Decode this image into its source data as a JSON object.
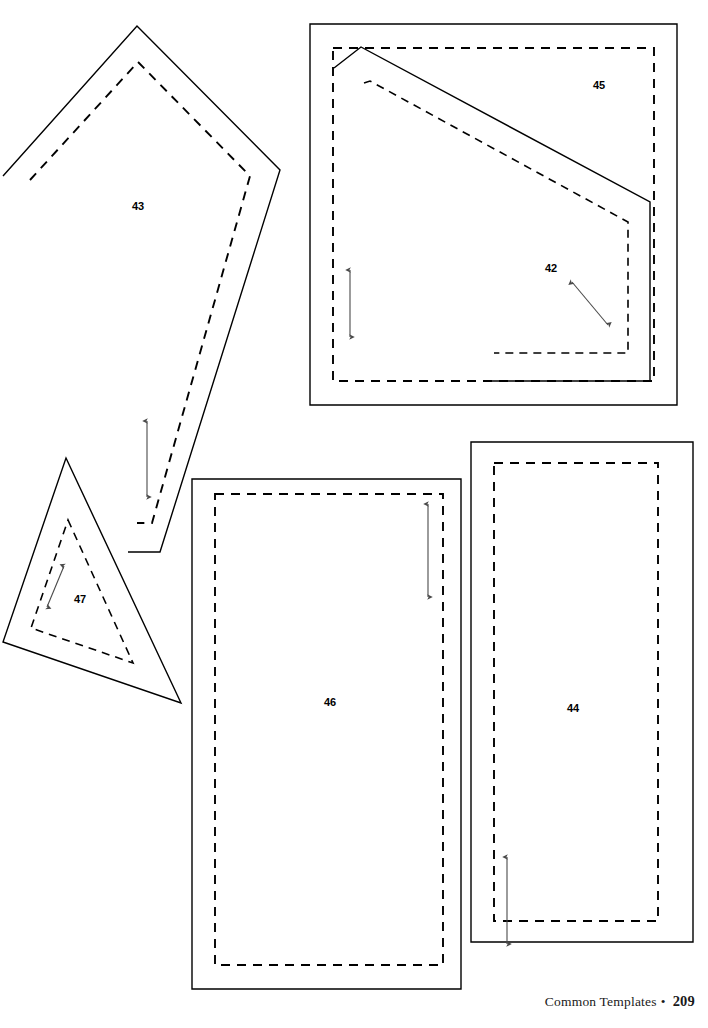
{
  "page": {
    "width": 708,
    "height": 1028,
    "background_color": "#ffffff",
    "ink_color": "#000000",
    "arrow_color": "#4a4a4a"
  },
  "footer": {
    "title": "Common Templates",
    "separator": "•",
    "page_number": "209"
  },
  "templates": [
    {
      "id": "43",
      "label": "43",
      "shape": "kite",
      "label_x": 138,
      "label_y": 207,
      "cut_line": "3,176 137,26 280,170 160,552 128,552",
      "seam_line": "30,180 138,62 250,176 152,523 137,523",
      "grain": {
        "x1": 147,
        "y1": 421,
        "x2": 147,
        "y2": 497,
        "double": true
      }
    },
    {
      "id": "45",
      "label": "45",
      "shape": "rectangle-frame",
      "label_x": 599,
      "label_y": 86,
      "cut_line": "310,24 677,24 677,405 310,405",
      "seam_line": "333,48 654,48 654,381 333,381",
      "grain": {
        "x1": 350,
        "y1": 270,
        "x2": 350,
        "y2": 337,
        "double": true
      }
    },
    {
      "id": "42",
      "label": "42",
      "shape": "quadrilateral",
      "label_x": 551,
      "label_y": 269,
      "cut_line": "334,68 361,47 650,202 650,381 483,381",
      "seam_line": "364,83 370,81 628,222 628,353 494,353",
      "grain": {
        "x1": 572,
        "y1": 282,
        "x2": 608,
        "y2": 325,
        "double": true
      }
    },
    {
      "id": "47",
      "label": "47",
      "shape": "triangle",
      "label_x": 80,
      "label_y": 600,
      "cut_line": "66,458 181,703 3,642",
      "seam_line": "68,520 133,663 31,628",
      "grain": {
        "x1": 64,
        "y1": 566,
        "x2": 47,
        "y2": 607,
        "double": true
      }
    },
    {
      "id": "46",
      "label": "46",
      "shape": "rectangle",
      "label_x": 330,
      "label_y": 703,
      "cut_line": "192,479 461,479 461,989 192,989",
      "seam_line": "215,494 443,494 443,965 215,965",
      "grain": {
        "x1": 428,
        "y1": 504,
        "x2": 428,
        "y2": 597,
        "double": true
      }
    },
    {
      "id": "44",
      "label": "44",
      "shape": "rectangle",
      "label_x": 573,
      "label_y": 709,
      "cut_line": "471,442 693,442 693,942 471,942",
      "seam_line": "494,463 658,463 658,921 494,921",
      "grain": {
        "x1": 507,
        "y1": 857,
        "x2": 507,
        "y2": 944,
        "double": true
      }
    }
  ]
}
